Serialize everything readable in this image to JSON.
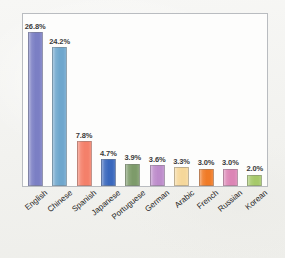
{
  "chart_data": {
    "type": "bar",
    "title": "",
    "subtitle": "",
    "xlabel": "",
    "ylabel": "",
    "grid": false,
    "legend": "none",
    "ylim": [
      0,
      30
    ],
    "categories": [
      "English",
      "Chinese",
      "Spanish",
      "Japanese",
      "Portuguese",
      "German",
      "Arabic",
      "French",
      "Russian",
      "Korean"
    ],
    "values": [
      26.8,
      24.2,
      7.8,
      4.7,
      3.9,
      3.6,
      3.3,
      3.0,
      3.0,
      2.0
    ],
    "value_labels": [
      "26.8%",
      "24.2%",
      "7.8%",
      "4.7%",
      "3.9%",
      "3.6%",
      "3.3%",
      "3.0%",
      "3.0%",
      "2.0%"
    ],
    "bar_colors": [
      "#7b7fc4",
      "#6fa7cd",
      "#f4806a",
      "#3a68bd",
      "#7d9b6a",
      "#bd8ccb",
      "#f5d79a",
      "#f07b27",
      "#dc85b5",
      "#a6c96a"
    ],
    "series": [
      {
        "name": "Share of web content",
        "values": [
          26.8,
          24.2,
          7.8,
          4.7,
          3.9,
          3.6,
          3.3,
          3.0,
          3.0,
          2.0
        ]
      }
    ],
    "bars": [
      {
        "category": "English",
        "value": 26.8,
        "label": "26.8%",
        "color": "#7b7fc4"
      },
      {
        "category": "Chinese",
        "value": 24.2,
        "label": "24.2%",
        "color": "#6fa7cd"
      },
      {
        "category": "Spanish",
        "value": 7.8,
        "label": "7.8%",
        "color": "#f4806a"
      },
      {
        "category": "Japanese",
        "value": 4.7,
        "label": "4.7%",
        "color": "#3a68bd"
      },
      {
        "category": "Portuguese",
        "value": 3.9,
        "label": "3.9%",
        "color": "#7d9b6a"
      },
      {
        "category": "German",
        "value": 3.6,
        "label": "3.6%",
        "color": "#bd8ccb"
      },
      {
        "category": "Arabic",
        "value": 3.3,
        "label": "3.3%",
        "color": "#f5d79a"
      },
      {
        "category": "French",
        "value": 3.0,
        "label": "3.0%",
        "color": "#f07b27"
      },
      {
        "category": "Russian",
        "value": 3.0,
        "label": "3.0%",
        "color": "#dc85b5"
      },
      {
        "category": "Korean",
        "value": 2.0,
        "label": "2.0%",
        "color": "#a6c96a"
      }
    ]
  },
  "figure": {
    "frame_color": "#b9bcc0",
    "plot_background": "#fdfdfc",
    "page_background": "#f4f4f2"
  }
}
